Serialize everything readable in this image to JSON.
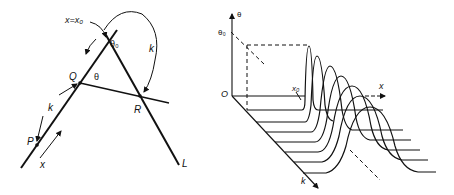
{
  "left_diagram": {
    "labels": {
      "x_eq_x0": "x=x₀",
      "theta0": "θ₀",
      "theta": "θ",
      "Q": "Q",
      "R": "R",
      "P": "P",
      "L": "L",
      "k_upper": "k",
      "k_lower": "k",
      "x": "x"
    }
  },
  "right_diagram": {
    "labels": {
      "theta_axis": "θ",
      "theta0": "θ₀",
      "origin": "O",
      "x0": "x₀",
      "x_axis": "x",
      "k_axis": "k"
    },
    "curve_count": 7
  },
  "colors": {
    "ink": "#111111",
    "background": "#ffffff"
  }
}
